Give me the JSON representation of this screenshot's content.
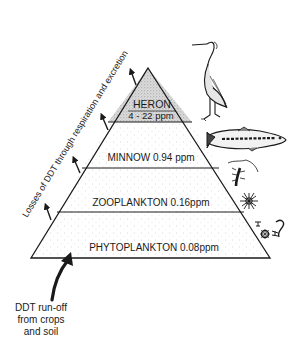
{
  "diagram": {
    "side_label": "Losses of DDT through respiration and excretion",
    "levels": [
      {
        "name": "HERON",
        "concentration": "4-22 ppm",
        "icon": "heron-icon"
      },
      {
        "name": "MINNOW",
        "concentration": "0.94 ppm",
        "label": "MINNOW 0.94 ppm",
        "icon": "minnow-fish-icon"
      },
      {
        "name": "ZOOPLANKTON",
        "concentration": "0.16ppm",
        "label": "ZOOPLANKTON 0.16ppm",
        "icon": "zooplankton-icon"
      },
      {
        "name": "PHYTOPLANKTON",
        "concentration": "0.08ppm",
        "label": "PHYTOPLANKTON 0.08ppm",
        "icon": "phytoplankton-icon"
      }
    ],
    "heron_name": "HERON",
    "heron_conc": "4 - 22 ppm",
    "runoff": {
      "line1": "DDT run-off",
      "line2": "from crops",
      "line3": "and soil"
    },
    "colors": {
      "ink": "#1a1a1a",
      "stipple_light": "#c8c8c8",
      "stipple_dense": "#8a8a8a",
      "background": "#ffffff"
    }
  }
}
